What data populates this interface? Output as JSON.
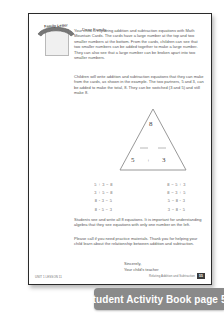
{
  "sheet": {
    "badge": {
      "label": "Family Letter",
      "icon": "family-letter-badge"
    },
    "salutation": "Dear Family,",
    "paragraphs": [
      "Your child is exploring addition and subtraction equations with Math Mountain Cards. The cards have a large number at the top and two smaller numbers at the bottom. From the cards, children can see that two smaller numbers can be added together to make a large number. They can also see that a large number can be broken apart into two smaller numbers.",
      "Children will write addition and subtraction equations that they can make from the cards, as shown in the example. The two partners, 5 and 3, can be added to make the total, 8. They can be switched (3 and 5) and still make 8.",
      "Students see and write all 8 equations. It is important for understanding algebra that they see equations with only one number on the left.",
      "Please call if you need practice materials. Thank you for helping your child learn about the relationship between addition and subtraction."
    ],
    "mountain": {
      "total": "8",
      "partner_left": "5",
      "operator": "+",
      "partner_right": "3"
    },
    "equations": {
      "left_column": [
        "5 + 3 = 8",
        "3 + 5 = 8",
        "8 - 3 = 5",
        "8 - 5 = 3"
      ],
      "right_column": [
        "8 = 5 + 3",
        "8 = 3 + 5",
        "5 = 8 - 3",
        "3 = 8 - 5"
      ]
    },
    "signoff": {
      "closing": "Sincerely,",
      "signer": "Your child's teacher"
    },
    "footer": {
      "left": "UNIT 1 LESSON 11",
      "right": "Relating Addition and Subtraction",
      "page_number": "55"
    }
  },
  "banner": {
    "caption": "Student Activity Book page 55"
  },
  "colors": {
    "banner_bg": "#8a8a8a",
    "banner_text": "#ffffff",
    "page_border": "#2b2b2b",
    "body_text": "#555555"
  }
}
